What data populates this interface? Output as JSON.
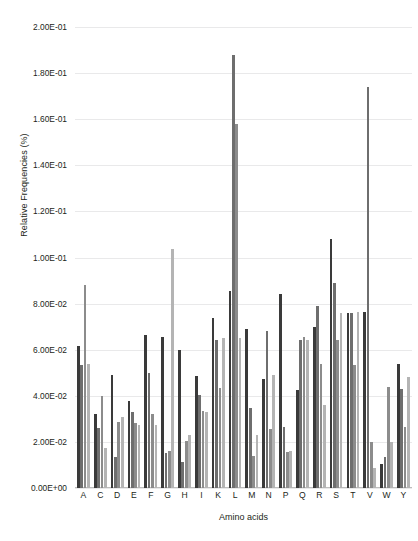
{
  "chart_data": {
    "type": "bar",
    "title": "",
    "xlabel": "Amino acids",
    "ylabel": "Relative Frequencies (%)",
    "ylim": [
      0,
      0.2
    ],
    "ytick_values": [
      0,
      0.02,
      0.04,
      0.06,
      0.08,
      0.1,
      0.12,
      0.14,
      0.16,
      0.18,
      0.2
    ],
    "ytick_labels": [
      "0.00E+00",
      "2.00E-02",
      "4.00E-02",
      "6.00E-02",
      "8.00E-02",
      "1.00E-01",
      "1.20E-01",
      "1.40E-01",
      "1.60E-01",
      "1.80E-01",
      "2.00E-01"
    ],
    "grid": true,
    "legend": "none",
    "categories": [
      "A",
      "C",
      "D",
      "E",
      "F",
      "G",
      "H",
      "I",
      "K",
      "L",
      "M",
      "N",
      "P",
      "Q",
      "R",
      "S",
      "T",
      "V",
      "W",
      "Y"
    ],
    "series": [
      {
        "name": "Series 1",
        "color": "#3a3a3a",
        "values": [
          0.0615,
          0.0322,
          0.0492,
          0.0378,
          0.0665,
          0.0655,
          0.06,
          0.0485,
          0.0738,
          0.0855,
          0.0688,
          0.0475,
          0.084,
          0.0425,
          0.07,
          0.108,
          0.076,
          0.0765,
          0.0105,
          0.054
        ]
      },
      {
        "name": "Series 2",
        "color": "#6e6e6e",
        "values": [
          0.0535,
          0.026,
          0.0135,
          0.033,
          0.05,
          0.015,
          0.0115,
          0.0405,
          0.064,
          0.188,
          0.0345,
          0.068,
          0.0265,
          0.064,
          0.079,
          0.089,
          0.076,
          0.174,
          0.0135,
          0.043
        ]
      },
      {
        "name": "Series 3",
        "color": "#8c8c8c",
        "values": [
          0.088,
          0.04,
          0.0285,
          0.028,
          0.032,
          0.016,
          0.0205,
          0.0335,
          0.0435,
          0.158,
          0.014,
          0.0255,
          0.0155,
          0.0655,
          0.054,
          0.064,
          0.0535,
          0.02,
          0.044,
          0.0265
        ]
      },
      {
        "name": "Series 4",
        "color": "#b4b4b4",
        "values": [
          0.054,
          0.0175,
          0.031,
          0.0275,
          0.0275,
          0.1035,
          0.023,
          0.033,
          0.065,
          0.065,
          0.023,
          0.049,
          0.016,
          0.064,
          0.036,
          0.076,
          0.0765,
          0.0085,
          0.02,
          0.048
        ]
      }
    ]
  }
}
